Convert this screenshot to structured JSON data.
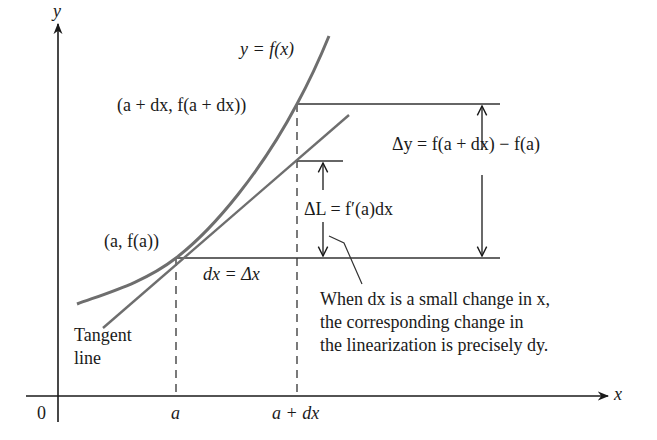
{
  "figure": {
    "axes": {
      "x_label": "x",
      "y_label": "y",
      "origin_label": "0",
      "x_ticks": [
        {
          "label": "a",
          "x": 176
        },
        {
          "label": "a + dx",
          "x": 297
        }
      ]
    },
    "curve": {
      "label": "y = f(x)",
      "color": "#6e6e6e"
    },
    "tangent": {
      "label_line1": "Tangent",
      "label_line2": "line",
      "color": "#6e6e6e"
    },
    "points": {
      "p1": "(a, f(a))",
      "p2": "(a + dx, f(a + dx))"
    },
    "annotations": {
      "dx": "dx = Δx",
      "delta_y": "Δy = f(a + dx) − f(a)",
      "delta_L": "ΔL = f′(a)dx",
      "note_line1": "When dx is a small change in x,",
      "note_line2": "the corresponding change in",
      "note_line3": "the linearization is precisely dy."
    },
    "colors": {
      "ink": "#1a1a1a",
      "curve": "#6e6e6e",
      "guide": "#333333"
    }
  }
}
